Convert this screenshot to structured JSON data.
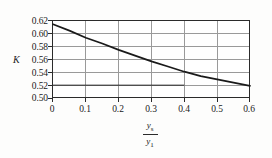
{
  "chart_data": {
    "type": "line",
    "title": "",
    "xlabel": "y_s / y_1",
    "ylabel": "K",
    "xlim": [
      0,
      0.6
    ],
    "ylim": [
      0.5,
      0.62
    ],
    "grid": true,
    "legend": "none",
    "x_ticks": [
      "0",
      "0.1",
      "0.2",
      "0.3",
      "0.4",
      "0.5",
      "0.6"
    ],
    "x_tick_values": [
      0,
      0.1,
      0.2,
      0.3,
      0.4,
      0.5,
      0.6
    ],
    "y_ticks": [
      "0.50",
      "0.52",
      "0.54",
      "0.56",
      "0.58",
      "0.60",
      "0.62"
    ],
    "y_tick_values": [
      0.5,
      0.52,
      0.54,
      0.56,
      0.58,
      0.6,
      0.62
    ],
    "series": [
      {
        "name": "K curve",
        "style": "solid",
        "color": "#1a1a1a",
        "x": [
          0,
          0.05,
          0.1,
          0.15,
          0.2,
          0.25,
          0.3,
          0.35,
          0.4,
          0.45,
          0.5,
          0.55,
          0.6
        ],
        "values": [
          0.615,
          0.605,
          0.594,
          0.585,
          0.575,
          0.566,
          0.557,
          0.549,
          0.541,
          0.534,
          0.529,
          0.524,
          0.519
        ]
      },
      {
        "name": "construction line",
        "style": "solid-thin",
        "color": "#1a1a1a",
        "x": [
          0,
          0.4
        ],
        "values": [
          0.52,
          0.52
        ]
      }
    ],
    "annotations": []
  },
  "axis": {
    "y_title": "K",
    "x_title_numerator": "y",
    "x_title_numerator_sub": "s",
    "x_title_denominator": "y",
    "x_title_denominator_sub": "1"
  },
  "colors": {
    "background": "#fdfdfc",
    "plot_background": "#ffffff",
    "frame": "#2b2b2b",
    "grid": "#9a9a9a",
    "curve": "#1a1a1a",
    "text": "#1a1a1a"
  }
}
